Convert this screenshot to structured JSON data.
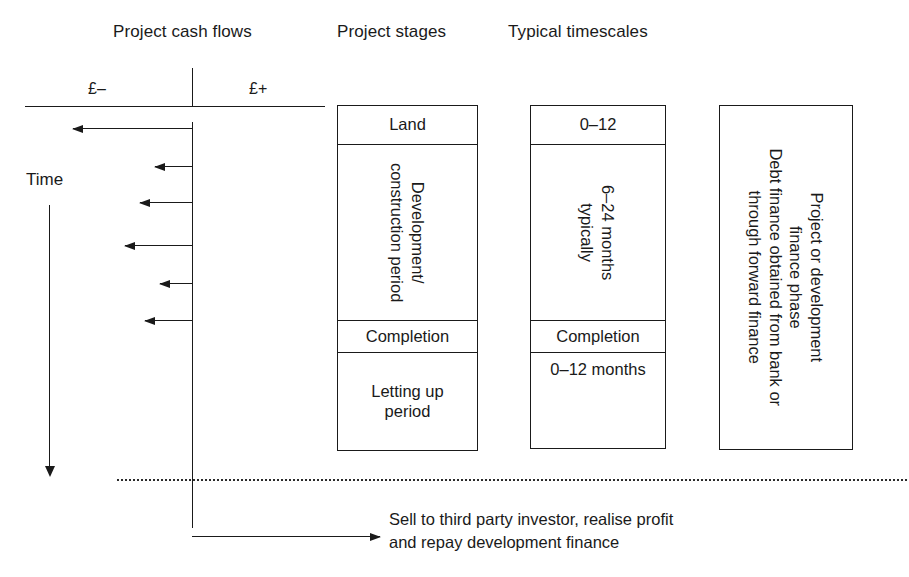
{
  "headings": {
    "cash_flows": "Project cash flows",
    "stages": "Project stages",
    "timescales": "Typical timescales"
  },
  "cash_flow_axis": {
    "negative_label": "£–",
    "positive_label": "£+",
    "time_label": "Time"
  },
  "cash_flow_arrows": [
    {
      "name": "land-purchase-outflow",
      "direction": "left",
      "y": 128,
      "tip_x": 73,
      "tail_x": 192
    },
    {
      "name": "construction-outflow-1",
      "direction": "left",
      "y": 166,
      "tip_x": 155,
      "tail_x": 192
    },
    {
      "name": "construction-outflow-2",
      "direction": "left",
      "y": 202,
      "tip_x": 140,
      "tail_x": 192
    },
    {
      "name": "construction-outflow-3",
      "direction": "left",
      "y": 245,
      "tip_x": 125,
      "tail_x": 192
    },
    {
      "name": "construction-outflow-4",
      "direction": "left",
      "y": 283,
      "tip_x": 160,
      "tail_x": 192
    },
    {
      "name": "construction-outflow-5",
      "direction": "left",
      "y": 320,
      "tip_x": 145,
      "tail_x": 192
    }
  ],
  "stages_box": {
    "rows": [
      {
        "label": "Land",
        "rotated": false,
        "top": 0,
        "height": 39,
        "divider": true
      },
      {
        "label": "Development/\nconstruction period",
        "rotated": true,
        "top": 39,
        "height": 176,
        "divider": true
      },
      {
        "label": "Completion",
        "rotated": false,
        "top": 215,
        "height": 32,
        "divider": true
      },
      {
        "label": "Letting up\nperiod",
        "rotated": false,
        "top": 247,
        "height": 97,
        "divider": false
      }
    ]
  },
  "timescales_box": {
    "rows": [
      {
        "label": "0–12",
        "rotated": false,
        "top": 0,
        "height": 39,
        "divider": true,
        "align": "center"
      },
      {
        "label": "6–24 months\ntypically",
        "rotated": true,
        "top": 39,
        "height": 176,
        "divider": true
      },
      {
        "label": "Completion",
        "rotated": false,
        "top": 215,
        "height": 32,
        "divider": true,
        "align": "center"
      },
      {
        "label": "0–12 months",
        "rotated": false,
        "top": 247,
        "height": 95,
        "divider": false,
        "align": "top"
      }
    ]
  },
  "finance_box": {
    "label": "Project or development\nfinance phase\nDebt finance obtained from bank or\nthrough forward finance"
  },
  "exit_note": {
    "line1": "Sell to third party investor, realise profit",
    "line2": "and repay development finance"
  },
  "colors": {
    "ink": "#1a1a1a",
    "background": "#ffffff"
  }
}
